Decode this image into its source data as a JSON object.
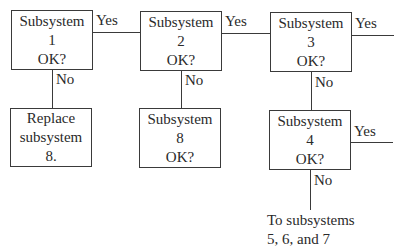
{
  "diagram": {
    "type": "flowchart",
    "nodes": [
      {
        "id": "sub1",
        "lines": [
          "Subsystem",
          "1",
          "OK?"
        ]
      },
      {
        "id": "sub2",
        "lines": [
          "Subsystem",
          "2",
          "OK?"
        ]
      },
      {
        "id": "sub3",
        "lines": [
          "Subsystem",
          "3",
          "OK?"
        ]
      },
      {
        "id": "replace8",
        "lines": [
          "Replace",
          "subsystem",
          "8."
        ]
      },
      {
        "id": "sub8",
        "lines": [
          "Subsystem",
          "8",
          "OK?"
        ]
      },
      {
        "id": "sub4",
        "lines": [
          "Subsystem",
          "4",
          "OK?"
        ]
      }
    ],
    "edges": [
      {
        "from": "sub1",
        "to": "sub2",
        "label": "Yes"
      },
      {
        "from": "sub2",
        "to": "sub3",
        "label": "Yes"
      },
      {
        "from": "sub3",
        "to": "continue-right",
        "label": "Yes"
      },
      {
        "from": "sub1",
        "to": "replace8",
        "label": "No"
      },
      {
        "from": "sub2",
        "to": "sub8",
        "label": "No"
      },
      {
        "from": "sub3",
        "to": "sub4",
        "label": "No"
      },
      {
        "from": "sub4",
        "to": "continue-right",
        "label": "Yes"
      },
      {
        "from": "sub4",
        "to": "to-subsystems-567",
        "label": "No"
      }
    ],
    "terminal": {
      "lines": [
        "To subsystems",
        "5, 6, and 7"
      ]
    }
  }
}
